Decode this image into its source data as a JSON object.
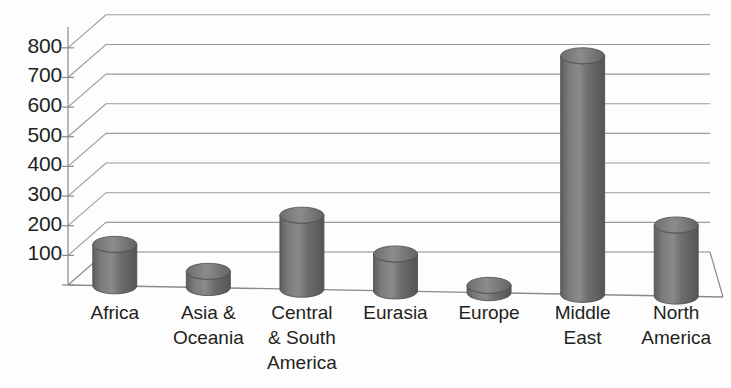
{
  "chart_data": {
    "type": "bar",
    "title": "",
    "subtitle": "",
    "xlabel": "",
    "ylabel": "",
    "categories": [
      "Africa",
      "Asia &\nOceania",
      "Central\n& South\nAmerica",
      "Eurasia",
      "Europe",
      "Middle\nEast",
      "North\nAmerica"
    ],
    "values": [
      140,
      55,
      250,
      125,
      25,
      805,
      240
    ],
    "series": [
      {
        "name": "Proved Reserves",
        "values": [
          140,
          55,
          250,
          125,
          25,
          805,
          240
        ]
      }
    ],
    "ylim": [
      0,
      850
    ],
    "yticks": [
      100,
      200,
      300,
      400,
      500,
      600,
      700,
      800
    ],
    "ytick_labels": [
      "100",
      "200",
      "300",
      "400",
      "500",
      "600",
      "700",
      "800"
    ],
    "grid": true,
    "legend": false,
    "legend_position": "none",
    "three_d": true,
    "bar_shape": "cylinder",
    "bar_color": "#6b6b6b",
    "bar_edge_color": "#4a4a4a",
    "gridline_color": "#9a9a9a",
    "axis_color": "#808080",
    "text_color": "#231f20",
    "background_color": "#fdfdfd"
  }
}
